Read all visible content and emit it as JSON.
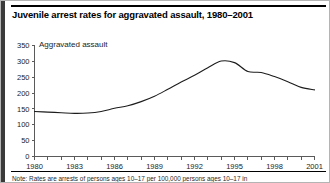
{
  "figure": {
    "title": "Juvenile arrest rates for aggravated assault, 1980–2001",
    "series_label": "Aggravated assault",
    "footnote": "Note: Rates are arrests of persons ages 10–17 per 100,000 persons ages 10–17 in",
    "colors": {
      "line": "#1c1c1c",
      "axis": "#5a5a5a",
      "frame": "#b4b4b4",
      "left_bar": "#3a3a3a",
      "background": "#ffffff"
    }
  },
  "chart_data": {
    "type": "line",
    "title": "Juvenile arrest rates for aggravated assault, 1980–2001",
    "xlabel": "",
    "ylabel": "",
    "xlim": [
      1980,
      2001
    ],
    "ylim": [
      0,
      350
    ],
    "grid": false,
    "legend": "inside-plot-top-left",
    "yticks": [
      0,
      50,
      100,
      150,
      200,
      250,
      300,
      350
    ],
    "ytick_labels": [
      "0",
      "50",
      "100",
      "150",
      "200",
      "250",
      "300",
      "350"
    ],
    "xticks": [
      1980,
      1981,
      1982,
      1983,
      1984,
      1985,
      1986,
      1987,
      1988,
      1989,
      1990,
      1991,
      1992,
      1993,
      1994,
      1995,
      1996,
      1997,
      1998,
      1999,
      2000,
      2001
    ],
    "xtick_labels_shown": [
      "1980",
      "1983",
      "1986",
      "1989",
      "1992",
      "1995",
      "1998",
      "2001"
    ],
    "xtick_label_interval": 3,
    "series": [
      {
        "name": "Aggravated assault",
        "x": [
          1980,
          1981,
          1982,
          1983,
          1984,
          1985,
          1986,
          1987,
          1988,
          1989,
          1990,
          1991,
          1992,
          1993,
          1994,
          1995,
          1996,
          1997,
          1998,
          1999,
          2000,
          2001
        ],
        "values": [
          142,
          140,
          138,
          136,
          137,
          142,
          152,
          160,
          173,
          190,
          212,
          235,
          256,
          280,
          301,
          296,
          268,
          265,
          252,
          236,
          218,
          210
        ]
      }
    ]
  }
}
